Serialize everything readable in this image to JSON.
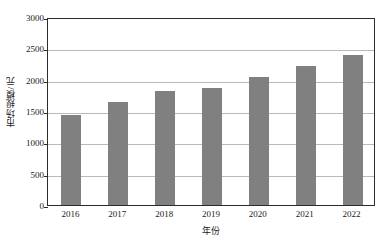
{
  "chart_data": {
    "type": "bar",
    "title": "",
    "subtitle": "",
    "xlabel": "年份",
    "ylabel": "市场规模/元",
    "categories": [
      "2016",
      "2017",
      "2018",
      "2019",
      "2020",
      "2021",
      "2022"
    ],
    "values": [
      1440,
      1650,
      1815,
      1860,
      2040,
      2220,
      2400
    ],
    "series": [
      {
        "name": "市场规模",
        "values": [
          1440,
          1650,
          1815,
          1860,
          2040,
          2220,
          2400
        ]
      }
    ],
    "ylim": [
      0,
      3000
    ],
    "yticks": [
      0,
      500,
      1000,
      1500,
      2000,
      2500,
      3000
    ],
    "ytick_labels": [
      "0",
      "500",
      "1000",
      "1500",
      "2000",
      "2500",
      "3000"
    ],
    "grid": "horizontal",
    "legend": "none",
    "annotations": [],
    "colors": {
      "bar_fill": "#808080",
      "gridline": "#b9b9b9",
      "axis_line": "#2b2b2b",
      "text": "#1a1a1a",
      "background": "#ffffff"
    }
  }
}
